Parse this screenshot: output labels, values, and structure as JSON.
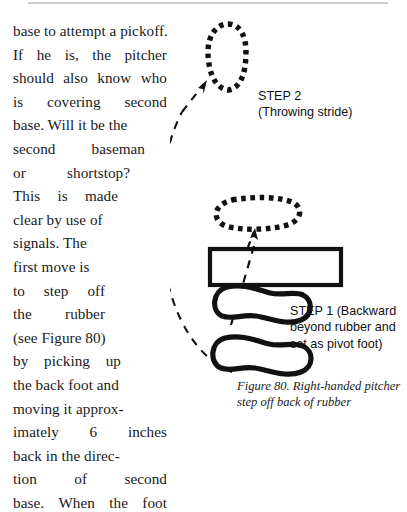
{
  "page": {
    "width": 407,
    "height": 441,
    "background": "#ffffff",
    "rule_color": "#cdcdcd"
  },
  "body_text": {
    "lines": [
      "base to attempt a pickoff.",
      "If he is, the pitcher",
      "should also know who",
      "is covering second",
      "base. Will it be the",
      "second baseman",
      "or   shortstop?",
      "This is made",
      "clear by use of",
      "signals. The",
      "first move is",
      "to step off",
      "the rubber",
      "(see Figure 80)",
      "by picking up",
      "the back foot and",
      "moving it approx-",
      "imately 6 inches",
      "back in the direc-",
      "tion of second",
      "base. When the foot"
    ],
    "justified_lines": [
      {
        "index": 1,
        "words": [
          "If",
          "he",
          "is,",
          "the",
          "pitcher"
        ]
      },
      {
        "index": 2,
        "words": [
          "should",
          "also",
          "know",
          "who"
        ]
      },
      {
        "index": 3,
        "words": [
          "is",
          "covering",
          "second"
        ]
      },
      {
        "index": 5,
        "words": [
          "second",
          "baseman"
        ]
      },
      {
        "index": 6,
        "words": [
          "or",
          "shortstop?"
        ]
      },
      {
        "index": 7,
        "words": [
          "This",
          "is",
          "made"
        ]
      },
      {
        "index": 11,
        "words": [
          "to",
          "step",
          "off"
        ]
      },
      {
        "index": 12,
        "words": [
          "the",
          "rubber"
        ]
      },
      {
        "index": 14,
        "words": [
          "by",
          "picking",
          "up"
        ]
      },
      {
        "index": 17,
        "words": [
          "imately",
          "6",
          "inches"
        ]
      },
      {
        "index": 19,
        "words": [
          "tion",
          "of",
          "second"
        ]
      },
      {
        "index": 20,
        "words": [
          "base.",
          "When",
          "the",
          "foot"
        ]
      }
    ]
  },
  "figure": {
    "step2": {
      "title": "STEP 2",
      "subtitle": "(Throwing stride)"
    },
    "step1": {
      "line1": "STEP 1 (Backward",
      "line2": "beyond rubber and",
      "line3": "set as pivot foot)"
    },
    "caption": {
      "line1": "Figure 80. Right-handed pitcher",
      "line2": "step off back of rubber"
    },
    "colors": {
      "ink": "#111111",
      "dash": "#111111",
      "rubber_fill": "#ffffff"
    },
    "shapes": {
      "step2_foot": "dashed-vertical-oval",
      "pivot_foot_dashed": "dashed-horizontal-oval",
      "rubber": "rectangle-outline",
      "pivot_foot_solid": "solid-outline-peanut-foot",
      "back_foot_solid": "solid-outline-peanut-foot",
      "stride_path": "long-dashed-curve-with-arrowhead",
      "short_arrow": "short-dashed-arrow"
    }
  }
}
